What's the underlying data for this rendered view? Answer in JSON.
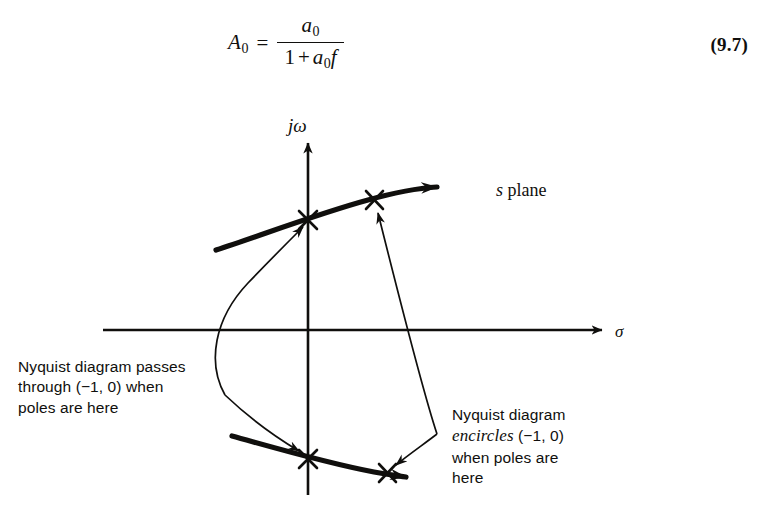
{
  "equation": {
    "lhs_symbol": "A",
    "lhs_subscript": "0",
    "equals": "=",
    "numerator_symbol": "a",
    "numerator_subscript": "0",
    "denominator_one": "1",
    "denominator_plus": "+",
    "denominator_a": "a",
    "denominator_a_subscript": "0",
    "denominator_f": "f",
    "number": "(9.7)"
  },
  "figure": {
    "axis_vertical_label": "jω",
    "axis_horizontal_label": "σ",
    "plane_label_italic": "s",
    "plane_label_rest": " plane",
    "callout_left": {
      "line1": "Nyquist diagram passes",
      "line2": "through (−1, 0) when",
      "line3": "poles are here"
    },
    "callout_right": {
      "line1": "Nyquist diagram",
      "line2_italic": "encircles",
      "line2_rest": " (−1, 0)",
      "line3": "when poles are",
      "line4": "here"
    },
    "pole_marker_symbol": "×",
    "pole_markers": [
      {
        "name": "upper-left-pole",
        "x": 308,
        "y": 125
      },
      {
        "name": "upper-right-pole",
        "x": 374,
        "y": 105
      },
      {
        "name": "lower-left-pole",
        "x": 308,
        "y": 364
      },
      {
        "name": "lower-right-pole",
        "x": 387,
        "y": 378
      }
    ],
    "colors": {
      "ink": "#100f0d",
      "background": "#ffffff"
    }
  }
}
